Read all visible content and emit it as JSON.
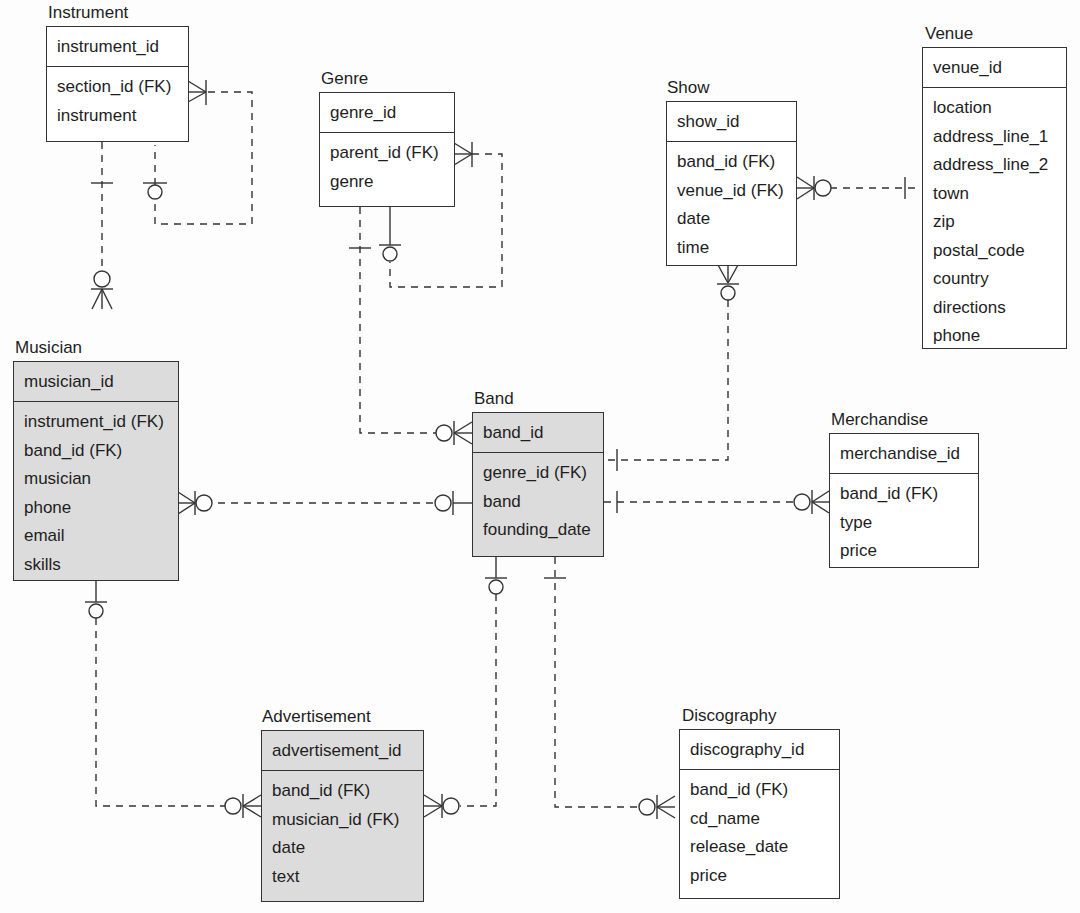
{
  "diagram": {
    "type": "entity-relationship",
    "notation": "crow's foot",
    "entities": {
      "instrument": {
        "title": "Instrument",
        "pk": "instrument_id",
        "attributes": [
          "section_id (FK)",
          "instrument"
        ],
        "shaded": false
      },
      "genre": {
        "title": "Genre",
        "pk": "genre_id",
        "attributes": [
          "parent_id (FK)",
          "genre"
        ],
        "shaded": false
      },
      "show": {
        "title": "Show",
        "pk": "show_id",
        "attributes": [
          "band_id (FK)",
          "venue_id (FK)",
          "date",
          "time"
        ],
        "shaded": false
      },
      "venue": {
        "title": "Venue",
        "pk": "venue_id",
        "attributes": [
          "location",
          "address_line_1",
          "address_line_2",
          "town",
          "zip",
          "postal_code",
          "country",
          "directions",
          "phone"
        ],
        "shaded": false
      },
      "musician": {
        "title": "Musician",
        "pk": "musician_id",
        "attributes": [
          "instrument_id (FK)",
          "band_id (FK)",
          "musician",
          "phone",
          "email",
          "skills"
        ],
        "shaded": true
      },
      "band": {
        "title": "Band",
        "pk": "band_id",
        "attributes": [
          "genre_id (FK)",
          "band",
          "founding_date"
        ],
        "shaded": true
      },
      "merchandise": {
        "title": "Merchandise",
        "pk": "merchandise_id",
        "attributes": [
          "band_id (FK)",
          "type",
          "price"
        ],
        "shaded": false
      },
      "advertisement": {
        "title": "Advertisement",
        "pk": "advertisement_id",
        "attributes": [
          "band_id (FK)",
          "musician_id (FK)",
          "date",
          "text"
        ],
        "shaded": true
      },
      "discography": {
        "title": "Discography",
        "pk": "discography_id",
        "attributes": [
          "band_id (FK)",
          "cd_name",
          "release_date",
          "price"
        ],
        "shaded": false
      }
    },
    "relationships": [
      {
        "from": "Instrument",
        "to": "Instrument",
        "label": "section (self-reference)",
        "from_card": "zero-or-one",
        "to_card": "one-or-many"
      },
      {
        "from": "Instrument",
        "to": "Musician",
        "from_card": "exactly-one",
        "to_card": "zero-or-many"
      },
      {
        "from": "Genre",
        "to": "Genre",
        "label": "parent (self-reference)",
        "from_card": "zero-or-one",
        "to_card": "one-or-many"
      },
      {
        "from": "Genre",
        "to": "Band",
        "from_card": "exactly-one",
        "to_card": "zero-or-many"
      },
      {
        "from": "Venue",
        "to": "Show",
        "from_card": "exactly-one",
        "to_card": "zero-or-many"
      },
      {
        "from": "Band",
        "to": "Show",
        "from_card": "exactly-one",
        "to_card": "zero-or-many"
      },
      {
        "from": "Band",
        "to": "Musician",
        "from_card": "zero-or-one",
        "to_card": "zero-or-many"
      },
      {
        "from": "Band",
        "to": "Merchandise",
        "from_card": "exactly-one",
        "to_card": "zero-or-many"
      },
      {
        "from": "Band",
        "to": "Advertisement",
        "from_card": "zero-or-one",
        "to_card": "zero-or-many"
      },
      {
        "from": "Band",
        "to": "Discography",
        "from_card": "exactly-one",
        "to_card": "zero-or-many"
      },
      {
        "from": "Musician",
        "to": "Advertisement",
        "from_card": "zero-or-one",
        "to_card": "zero-or-many"
      }
    ]
  },
  "colors": {
    "line": "#333333",
    "shaded_fill": "#dcdcdc",
    "plain_fill": "#ffffff",
    "background": "#fdfdfd"
  }
}
